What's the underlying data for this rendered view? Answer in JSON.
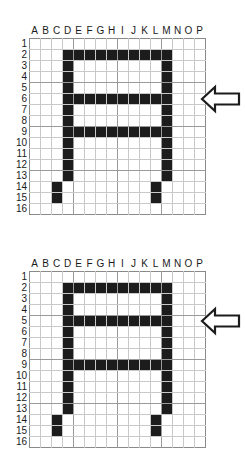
{
  "figure": {
    "grid": {
      "columns": [
        "A",
        "B",
        "C",
        "D",
        "E",
        "F",
        "G",
        "H",
        "I",
        "J",
        "K",
        "L",
        "M",
        "N",
        "O",
        "P"
      ],
      "rows": [
        "1",
        "2",
        "3",
        "4",
        "5",
        "6",
        "7",
        "8",
        "9",
        "10",
        "11",
        "12",
        "13",
        "14",
        "15",
        "16"
      ],
      "cell_size_px": 11,
      "filled_color": "#1c1c1c",
      "empty_color": "#ffffff",
      "gridline_color": "#c9c9c9",
      "border_color": "#8a8a8a"
    }
  },
  "panels": [
    {
      "id": "panel-top",
      "name": "top-grid",
      "arrow": {
        "icon": "arrow-left-icon",
        "points_to_row": "6",
        "row_index": 5,
        "color": "#1c1c1c"
      },
      "filled_cells": [
        [
          1,
          3
        ],
        [
          1,
          4
        ],
        [
          1,
          5
        ],
        [
          1,
          6
        ],
        [
          1,
          7
        ],
        [
          1,
          8
        ],
        [
          1,
          9
        ],
        [
          1,
          10
        ],
        [
          1,
          11
        ],
        [
          1,
          12
        ],
        [
          2,
          3
        ],
        [
          2,
          12
        ],
        [
          3,
          3
        ],
        [
          3,
          12
        ],
        [
          4,
          3
        ],
        [
          4,
          12
        ],
        [
          5,
          3
        ],
        [
          5,
          4
        ],
        [
          5,
          5
        ],
        [
          5,
          6
        ],
        [
          5,
          7
        ],
        [
          5,
          8
        ],
        [
          5,
          9
        ],
        [
          5,
          10
        ],
        [
          5,
          11
        ],
        [
          5,
          12
        ],
        [
          6,
          3
        ],
        [
          6,
          12
        ],
        [
          7,
          3
        ],
        [
          7,
          12
        ],
        [
          8,
          3
        ],
        [
          8,
          4
        ],
        [
          8,
          5
        ],
        [
          8,
          6
        ],
        [
          8,
          7
        ],
        [
          8,
          8
        ],
        [
          8,
          9
        ],
        [
          8,
          10
        ],
        [
          8,
          11
        ],
        [
          8,
          12
        ],
        [
          9,
          3
        ],
        [
          9,
          12
        ],
        [
          10,
          3
        ],
        [
          10,
          12
        ],
        [
          11,
          3
        ],
        [
          11,
          12
        ],
        [
          12,
          3
        ],
        [
          12,
          12
        ],
        [
          13,
          2
        ],
        [
          13,
          11
        ],
        [
          14,
          2
        ],
        [
          14,
          11
        ]
      ]
    },
    {
      "id": "panel-bottom",
      "name": "bottom-grid",
      "arrow": {
        "icon": "arrow-left-icon",
        "points_to_row": "5",
        "row_index": 4,
        "color": "#1c1c1c"
      },
      "filled_cells": [
        [
          1,
          3
        ],
        [
          1,
          4
        ],
        [
          1,
          5
        ],
        [
          1,
          6
        ],
        [
          1,
          7
        ],
        [
          1,
          8
        ],
        [
          1,
          9
        ],
        [
          1,
          10
        ],
        [
          1,
          11
        ],
        [
          1,
          12
        ],
        [
          2,
          3
        ],
        [
          2,
          12
        ],
        [
          3,
          3
        ],
        [
          3,
          12
        ],
        [
          4,
          3
        ],
        [
          4,
          4
        ],
        [
          4,
          5
        ],
        [
          4,
          6
        ],
        [
          4,
          7
        ],
        [
          4,
          8
        ],
        [
          4,
          9
        ],
        [
          4,
          10
        ],
        [
          4,
          11
        ],
        [
          4,
          12
        ],
        [
          5,
          3
        ],
        [
          5,
          12
        ],
        [
          6,
          3
        ],
        [
          6,
          12
        ],
        [
          7,
          3
        ],
        [
          7,
          12
        ],
        [
          8,
          3
        ],
        [
          8,
          4
        ],
        [
          8,
          5
        ],
        [
          8,
          6
        ],
        [
          8,
          7
        ],
        [
          8,
          8
        ],
        [
          8,
          9
        ],
        [
          8,
          10
        ],
        [
          8,
          11
        ],
        [
          8,
          12
        ],
        [
          9,
          3
        ],
        [
          9,
          12
        ],
        [
          10,
          3
        ],
        [
          10,
          12
        ],
        [
          11,
          3
        ],
        [
          11,
          12
        ],
        [
          12,
          3
        ],
        [
          12,
          12
        ],
        [
          13,
          2
        ],
        [
          13,
          11
        ],
        [
          14,
          2
        ],
        [
          14,
          11
        ]
      ]
    }
  ]
}
